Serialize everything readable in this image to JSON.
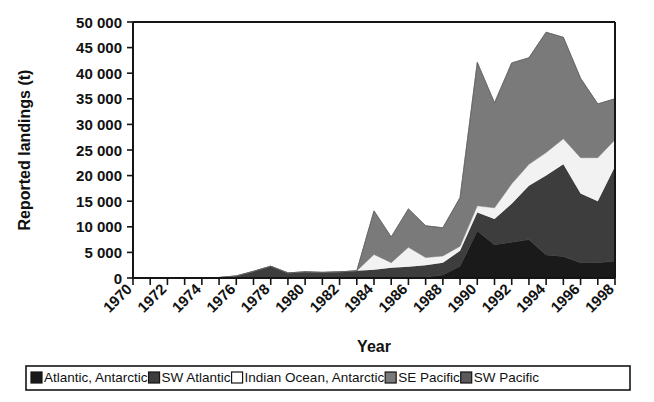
{
  "chart_data": {
    "type": "area",
    "stacked": true,
    "title": "",
    "xlabel": "Year",
    "ylabel": "Reported landings (t)",
    "xlim": [
      1970,
      1998
    ],
    "ylim": [
      0,
      50000
    ],
    "ytick_step": 5000,
    "xtick_step": 2,
    "grid": false,
    "legend_position": "bottom",
    "x": [
      1970,
      1971,
      1972,
      1973,
      1974,
      1975,
      1976,
      1977,
      1978,
      1979,
      1980,
      1981,
      1982,
      1983,
      1984,
      1985,
      1986,
      1987,
      1988,
      1989,
      1990,
      1991,
      1992,
      1993,
      1994,
      1995,
      1996,
      1997,
      1998
    ],
    "xtick_labels": [
      "1970",
      "1972",
      "1974",
      "1976",
      "1978",
      "1980",
      "1982",
      "1984",
      "1986",
      "1988",
      "1990",
      "1992",
      "1994",
      "1996",
      "1998"
    ],
    "ytick_labels": [
      "0",
      "5 000",
      "10 000",
      "15 000",
      "20 000",
      "25 000",
      "30 000",
      "35 000",
      "40 000",
      "45 000",
      "50 000"
    ],
    "series": [
      {
        "name": "Atlantic, Antarctic",
        "color": "#1a1a1a",
        "values": [
          0,
          0,
          0,
          0,
          0,
          0,
          0,
          0,
          0,
          0,
          0,
          0,
          0,
          0,
          0,
          0,
          0,
          200,
          600,
          2300,
          9200,
          6500,
          7000,
          7500,
          4500,
          4200,
          3000,
          3000,
          3300
        ]
      },
      {
        "name": "SW Atlantic",
        "color": "#3d3d3d",
        "values": [
          0,
          0,
          0,
          0,
          0,
          100,
          400,
          1300,
          2300,
          1000,
          1200,
          1100,
          1200,
          1400,
          1600,
          2000,
          2200,
          2300,
          2400,
          3000,
          3600,
          5000,
          7500,
          10500,
          15500,
          18000,
          13500,
          12000,
          18500
        ]
      },
      {
        "name": "Indian Ocean, Antarctic",
        "color": "#f2f2f2",
        "values": [
          0,
          0,
          0,
          0,
          0,
          0,
          0,
          0,
          0,
          0,
          0,
          0,
          0,
          0,
          3000,
          1000,
          3800,
          1500,
          1300,
          900,
          1300,
          2200,
          3900,
          4200,
          4500,
          5000,
          7000,
          8500,
          5200
        ]
      },
      {
        "name": "SE Pacific",
        "color": "#7a7a7a",
        "values": [
          0,
          0,
          0,
          0,
          0,
          0,
          0,
          0,
          0,
          0,
          0,
          0,
          0,
          0,
          8500,
          5000,
          7500,
          6200,
          5500,
          9500,
          28000,
          20500,
          23600,
          20800,
          23500,
          19800,
          15500,
          10500,
          8000
        ]
      },
      {
        "name": "SW Pacific",
        "color": "#5a5a5a",
        "values": [
          0,
          0,
          0,
          0,
          0,
          0,
          0,
          0,
          0,
          0,
          0,
          0,
          0,
          0,
          0,
          0,
          0,
          0,
          0,
          0,
          0,
          0,
          0,
          0,
          0,
          0,
          0,
          0,
          0
        ]
      }
    ]
  },
  "legend": {
    "items": [
      {
        "label": "Atlantic, Antarctic",
        "color": "#1a1a1a"
      },
      {
        "label": "SW Atlantic",
        "color": "#3d3d3d"
      },
      {
        "label": "Indian Ocean, Antarctic",
        "color": "#ffffff"
      },
      {
        "label": "SE Pacific",
        "color": "#7a7a7a"
      },
      {
        "label": "SW Pacific",
        "color": "#5a5a5a"
      }
    ]
  }
}
